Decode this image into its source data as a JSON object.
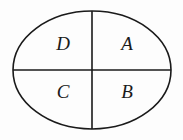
{
  "figure": {
    "name": "ellipse-quadrant-diagram",
    "background_color": "#fdfdfd",
    "stroke_color": "#1a1a1a",
    "label_color": "#1a1a1a",
    "canvas": {
      "width": 183,
      "height": 140
    },
    "ellipse": {
      "center_x": 92,
      "center_y": 70,
      "radius_x": 79,
      "radius_y": 59,
      "stroke_width": 1.6,
      "fill": "none"
    },
    "vertical_divider": {
      "x1": 92,
      "y1": 11,
      "x2": 92,
      "y2": 129,
      "stroke_width": 1.6
    },
    "horizontal_divider": {
      "x1": 13,
      "y1": 70,
      "x2": 171,
      "y2": 70,
      "stroke_width": 1.6
    },
    "labels": [
      {
        "text": "D",
        "x": 63,
        "y": 46,
        "quadrant": "upper-left"
      },
      {
        "text": "A",
        "x": 127,
        "y": 46,
        "quadrant": "upper-right"
      },
      {
        "text": "C",
        "x": 63,
        "y": 94,
        "quadrant": "lower-left"
      },
      {
        "text": "B",
        "x": 127,
        "y": 94,
        "quadrant": "lower-right"
      }
    ]
  }
}
